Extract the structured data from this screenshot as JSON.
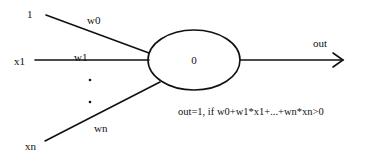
{
  "diagram": {
    "type": "perceptron",
    "inputs": [
      {
        "label": "1",
        "weight": "w0"
      },
      {
        "label": "x1",
        "weight": "w1"
      },
      {
        "label": "xn",
        "weight": "wn"
      }
    ],
    "ellipsis": ":",
    "neuron": {
      "label": "0"
    },
    "output": {
      "label": "out"
    },
    "rule": "out=1, if w0+w1*x1+...+wn*xn>0"
  }
}
